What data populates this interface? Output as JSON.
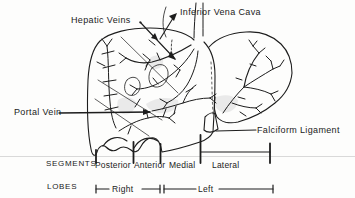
{
  "diagram": {
    "type": "anatomical-line-drawing",
    "background_color": "#fdfdfc",
    "ink_color": "#1d1d1d",
    "shading_color": "#dcdcdc",
    "faint_rule_color": "#cfcfcf",
    "labels": {
      "hepatic_veins": "Hepatic Veins",
      "inferior_vena_cava": "Inferior Vena Cava",
      "portal_vein": "Portal Vein",
      "falciform_ligament": "Falciform Ligament"
    },
    "segments": {
      "title": "SEGMENTS",
      "items": [
        "Posterior",
        "Anterior",
        "Medial",
        "Lateral"
      ]
    },
    "lobes": {
      "title": "LOBES",
      "items": [
        "Right",
        "Left"
      ]
    }
  }
}
